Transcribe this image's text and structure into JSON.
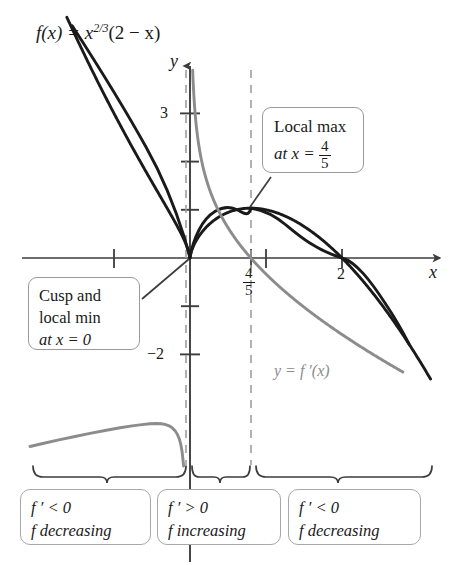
{
  "figure": {
    "title_prefix": "f(x) = x",
    "title_exponent": "2/3",
    "title_suffix": "(2 − x)",
    "function_label": "f(x) = x^(2/3)(2 − x)",
    "colors": {
      "function_curve": "#1a1a1a",
      "derivative_curve": "#8c8c8c",
      "axis": "#3d3d3d",
      "dashed_guide": "#9e9e9e",
      "callout_border": "#9a9a9a",
      "background": "#ffffff"
    }
  },
  "axes": {
    "x_label": "x",
    "y_label": "y",
    "y_ticks_labeled": [
      {
        "value": "3",
        "text": "3"
      },
      {
        "value": "-2",
        "text": "−2"
      }
    ],
    "x_ticks_labeled": [
      {
        "value": "0.8",
        "numerator": "4",
        "denominator": "5"
      },
      {
        "value": "2",
        "text": "2"
      }
    ]
  },
  "curve_labels": {
    "derivative": "y = f ′(x)"
  },
  "callouts": [
    {
      "id": "local-max",
      "lines": [
        "Local max",
        "at x = 4/5"
      ],
      "line1": "Local max",
      "line2_prefix": "at x = ",
      "line2_numerator": "4",
      "line2_denominator": "5"
    },
    {
      "id": "cusp-local-min",
      "line1": "Cusp and",
      "line2": "local min",
      "line3": "at x = 0"
    }
  ],
  "sign_boxes": [
    {
      "id": "interval-neg-1",
      "derivative": "f ′ < 0",
      "behavior": "f decreasing"
    },
    {
      "id": "interval-pos",
      "derivative": "f ′ > 0",
      "behavior": "f increasing"
    },
    {
      "id": "interval-neg-2",
      "derivative": "f ′ < 0",
      "behavior": "f decreasing"
    }
  ],
  "chart_data": {
    "type": "line",
    "xlabel": "x",
    "ylabel": "y",
    "xlim": [
      -1.6,
      3.4
    ],
    "ylim": [
      -2.9,
      3.9
    ],
    "grid": false,
    "legend_position": "inline-annotation",
    "series": [
      {
        "name": "f(x) = x^(2/3)(2 - x)",
        "color": "#1a1a1a",
        "points": [
          {
            "x": -1.55,
            "y": 4.84
          },
          {
            "x": -1.2,
            "y": 3.62
          },
          {
            "x": -1.0,
            "y": 3.0
          },
          {
            "x": -0.8,
            "y": 2.41
          },
          {
            "x": -0.6,
            "y": 1.83
          },
          {
            "x": -0.4,
            "y": 1.28
          },
          {
            "x": -0.2,
            "y": 0.75
          },
          {
            "x": -0.05,
            "y": 0.27
          },
          {
            "x": 0.0,
            "y": 0.0
          },
          {
            "x": 0.05,
            "y": 0.26
          },
          {
            "x": 0.2,
            "y": 0.62
          },
          {
            "x": 0.4,
            "y": 0.87
          },
          {
            "x": 0.6,
            "y": 1.0
          },
          {
            "x": 0.8,
            "y": 1.03
          },
          {
            "x": 1.0,
            "y": 1.0
          },
          {
            "x": 1.2,
            "y": 0.9
          },
          {
            "x": 1.5,
            "y": 0.65
          },
          {
            "x": 2.0,
            "y": 0.0
          },
          {
            "x": 2.5,
            "y": -0.92
          },
          {
            "x": 3.0,
            "y": -2.08
          },
          {
            "x": 3.25,
            "y": -2.71
          }
        ]
      },
      {
        "name": "y = f'(x)",
        "color": "#8c8c8c",
        "points": [
          {
            "x": 0.035,
            "y": 4.0
          },
          {
            "x": 0.06,
            "y": 3.4
          },
          {
            "x": 0.1,
            "y": 2.6
          },
          {
            "x": 0.2,
            "y": 1.7
          },
          {
            "x": 0.3,
            "y": 1.22
          },
          {
            "x": 0.5,
            "y": 0.65
          },
          {
            "x": 0.8,
            "y": 0.0
          },
          {
            "x": 1.0,
            "y": -0.33
          },
          {
            "x": 1.5,
            "y": -0.98
          },
          {
            "x": 2.0,
            "y": -1.58
          },
          {
            "x": 2.5,
            "y": -2.15
          },
          {
            "x": 3.0,
            "y": -2.68
          }
        ]
      },
      {
        "name": "y = f'(x) (left branch)",
        "color": "#8c8c8c",
        "points": [
          {
            "x": -1.55,
            "y": -2.37
          },
          {
            "x": -1.2,
            "y": -2.22
          },
          {
            "x": -0.9,
            "y": -2.1
          },
          {
            "x": -0.6,
            "y": -1.97
          },
          {
            "x": -0.4,
            "y": -1.9
          },
          {
            "x": -0.25,
            "y": -1.88
          },
          {
            "x": -0.18,
            "y": -1.92
          },
          {
            "x": -0.12,
            "y": -2.05
          },
          {
            "x": -0.07,
            "y": -2.35
          },
          {
            "x": -0.045,
            "y": -2.75
          },
          {
            "x": -0.035,
            "y": -3.0
          }
        ]
      }
    ],
    "annotations": [
      {
        "text": "Local max at x = 4/5",
        "x": 0.8,
        "y": 1.03
      },
      {
        "text": "Cusp and local min at x = 0",
        "x": 0.0,
        "y": 0.0
      },
      {
        "text": "y = f ′(x)",
        "x": 1.85,
        "y": -1.3
      },
      {
        "text": "vertical dashed guide",
        "x": 0.8,
        "y": null
      }
    ],
    "critical_points": [
      {
        "kind": "cusp / local minimum",
        "x": 0,
        "y": 0
      },
      {
        "kind": "local maximum",
        "x": 0.8,
        "y": 1.03
      },
      {
        "kind": "x-intercept",
        "x": 2,
        "y": 0
      }
    ]
  }
}
